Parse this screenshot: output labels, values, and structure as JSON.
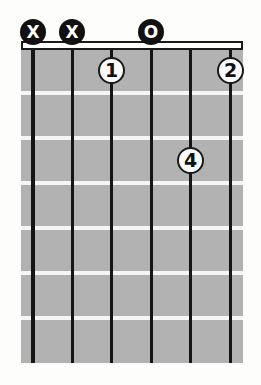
{
  "diagram": {
    "type": "guitar-chord-chart",
    "string_count": 6,
    "fret_space_count": 7,
    "headstock_markers": [
      {
        "string": 1,
        "symbol": "X",
        "meaning": "muted-string"
      },
      {
        "string": 2,
        "symbol": "X",
        "meaning": "muted-string"
      },
      {
        "string": 4,
        "symbol": "O",
        "meaning": "open-string"
      }
    ],
    "finger_markers": [
      {
        "string": 3,
        "fret": 1,
        "finger": "1"
      },
      {
        "string": 6,
        "fret": 1,
        "finger": "2"
      },
      {
        "string": 5,
        "fret": 3,
        "finger": "4"
      }
    ],
    "colors": {
      "background": "#fdfdfc",
      "fretboard": "#b2b2b2",
      "fret_line": "#f5f5f5",
      "string_line": "#151515",
      "nut_fill": "#ffffff",
      "nut_border": "#1a1a1a",
      "head_marker_fill": "#111111",
      "head_marker_text": "#ffffff",
      "finger_marker_fill": "#fbfbfb",
      "finger_marker_border": "#1a1a1a",
      "finger_marker_text": "#111111"
    }
  }
}
